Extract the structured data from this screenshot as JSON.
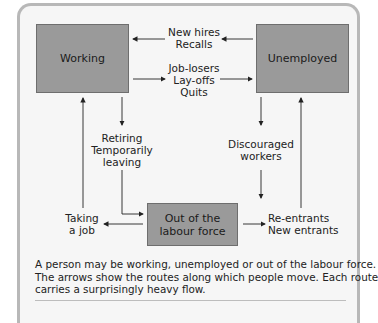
{
  "diagram": {
    "colors": {
      "box_fill": "#9a9a9a",
      "box_border": "#6e6e6e",
      "frame_border": "#b8b8b8",
      "background": "#f6f6f6",
      "arrow": "#222222"
    },
    "states": [
      {
        "id": "working",
        "label": "Working"
      },
      {
        "id": "unemployed",
        "label": "Unemployed"
      },
      {
        "id": "out_of_labour_force",
        "label_lines": [
          "Out of the",
          "labour force"
        ]
      }
    ],
    "flows": [
      {
        "from": "unemployed",
        "to": "working",
        "label_lines": [
          "New hires",
          "Recalls"
        ]
      },
      {
        "from": "working",
        "to": "unemployed",
        "label_lines": [
          "Job-losers",
          "Lay-offs",
          "Quits"
        ]
      },
      {
        "from": "working",
        "to": "out_of_labour_force",
        "label_lines": [
          "Retiring",
          "Temporarily",
          "leaving"
        ]
      },
      {
        "from": "unemployed",
        "to": "out_of_labour_force",
        "label_lines": [
          "Discouraged",
          "workers"
        ]
      },
      {
        "from": "out_of_labour_force",
        "to": "working",
        "label_lines": [
          "Taking",
          "a job"
        ]
      },
      {
        "from": "out_of_labour_force",
        "to": "unemployed",
        "label_lines": [
          "Re-entrants",
          "New entrants"
        ]
      }
    ]
  },
  "caption": {
    "lines": [
      "A person may be working, unemployed or out of the labour force.",
      "The arrows show the routes along which people move. Each route",
      "carries a surprisingly heavy flow."
    ]
  }
}
